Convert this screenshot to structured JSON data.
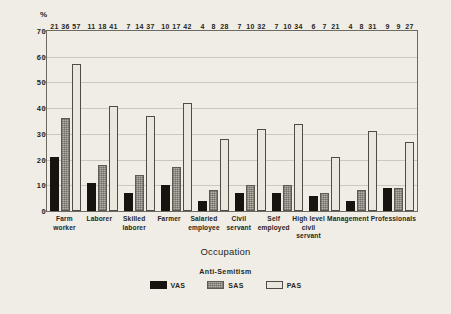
{
  "chart_data": {
    "type": "bar",
    "title": "",
    "xlabel": "Occupation",
    "ylabel": "%",
    "ylim": [
      0,
      70
    ],
    "yticks": [
      0,
      10,
      20,
      30,
      40,
      50,
      60,
      70
    ],
    "grid": true,
    "legend_title": "Anti-Semitism",
    "legend_position": "bottom-center",
    "categories": [
      "Farm worker",
      "Laborer",
      "Skilled laborer",
      "Farmer",
      "Salaried employee",
      "Civil servant",
      "Self employed",
      "High level civil servant",
      "Management",
      "Professionals"
    ],
    "category_lines": [
      [
        "Farm",
        "worker"
      ],
      [
        "Laborer",
        ""
      ],
      [
        "Skilled",
        "laborer"
      ],
      [
        "Farmer",
        ""
      ],
      [
        "Salaried",
        "employee"
      ],
      [
        "Civil",
        "servant"
      ],
      [
        "Self",
        "employed"
      ],
      [
        "High level",
        "civil servant"
      ],
      [
        "Management",
        ""
      ],
      [
        "Professionals",
        ""
      ]
    ],
    "series": [
      {
        "name": "VAS",
        "fill": "#17140f",
        "values": [
          21,
          11,
          7,
          10,
          4,
          7,
          7,
          6,
          4,
          9
        ]
      },
      {
        "name": "SAS",
        "fill": "#b3b0a7",
        "values": [
          36,
          18,
          14,
          17,
          8,
          10,
          10,
          7,
          8,
          9
        ]
      },
      {
        "name": "PAS",
        "fill": "#e9e7de",
        "values": [
          57,
          41,
          37,
          42,
          28,
          32,
          34,
          21,
          31,
          27
        ]
      }
    ]
  },
  "colors": {
    "background": "#efede6",
    "axis": "#6d6a61",
    "grid": "#cbc8be",
    "text": "#262521"
  }
}
